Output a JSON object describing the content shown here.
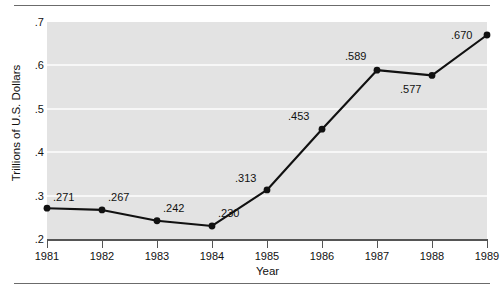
{
  "chart_data": {
    "type": "line",
    "title": "",
    "xlabel": "Year",
    "ylabel": "Trillions of U.S. Dollars",
    "categories": [
      "1981",
      "1982",
      "1983",
      "1984",
      "1985",
      "1986",
      "1987",
      "1988",
      "1989"
    ],
    "values": [
      0.271,
      0.267,
      0.242,
      0.23,
      0.313,
      0.453,
      0.589,
      0.577,
      0.67
    ],
    "point_labels": [
      ".271",
      ".267",
      ".242",
      ".230",
      ".313",
      ".453",
      ".589",
      ".577",
      ".670"
    ],
    "ylim": [
      0.2,
      0.7
    ],
    "xlim": [
      "1981",
      "1989"
    ],
    "ytick_labels": [
      ".2",
      ".3",
      ".4",
      ".5",
      ".6",
      ".7"
    ],
    "ytick_values": [
      0.2,
      0.3,
      0.4,
      0.5,
      0.6,
      0.7
    ],
    "grid": "horizontal-white-gridlines",
    "legend": "none",
    "colors": {
      "plot_background": "#e3e3e3",
      "gridline": "#f7f7f7",
      "line": "#111111",
      "marker": "#111111",
      "axis": "#555555",
      "rule": "#6b6b6b",
      "text": "#111111",
      "page_background": "#ffffff"
    },
    "label_offsets": [
      {
        "dx": 6,
        "dy": -17
      },
      {
        "dx": 6,
        "dy": -19
      },
      {
        "dx": 6,
        "dy": -19
      },
      {
        "dx": 6,
        "dy": -19
      },
      {
        "dx": -32,
        "dy": -18
      },
      {
        "dx": -34,
        "dy": -19
      },
      {
        "dx": -32,
        "dy": -20
      },
      {
        "dx": -32,
        "dy": 8
      },
      {
        "dx": -36,
        "dy": -6
      }
    ]
  }
}
